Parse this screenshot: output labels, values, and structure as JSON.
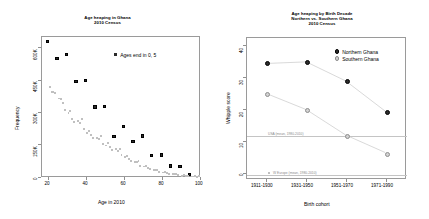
{
  "figure": {
    "width": 429,
    "height": 219,
    "background": "#ffffff",
    "colors": {
      "heaped": "#2b2b2b",
      "non_heaped": "#c0c0c0",
      "northern": "#2b2b2b",
      "southern": "#d2d2d2",
      "axis": "#9a9a9a",
      "reference_line": "#c4c4c4"
    }
  },
  "chart_data": [
    {
      "type": "scatter",
      "id": "age-heaping-scatter",
      "title": "Age heaping in Ghana",
      "subtitle": "2010 Census",
      "xlabel": "Age in 2010",
      "ylabel": "Frequency",
      "xlim": [
        17,
        101
      ],
      "ylim": [
        0,
        660000
      ],
      "xticks": [
        20,
        40,
        60,
        80,
        100
      ],
      "xtick_labels": [
        "20",
        "40",
        "60",
        "80",
        "100"
      ],
      "yticks": [
        0,
        150000,
        300000,
        450000,
        600000
      ],
      "ytick_labels": [
        "0",
        "150K",
        "300K",
        "450K",
        "600K"
      ],
      "grid": false,
      "legend_position": "top-right",
      "series": [
        {
          "name": "Ages end in 0, 5",
          "marker": "filled-square",
          "color": "#2b2b2b",
          "points": [
            {
              "x": 20,
              "y": 638000
            },
            {
              "x": 25,
              "y": 560000
            },
            {
              "x": 30,
              "y": 578000
            },
            {
              "x": 35,
              "y": 453000
            },
            {
              "x": 40,
              "y": 456000
            },
            {
              "x": 45,
              "y": 332000
            },
            {
              "x": 50,
              "y": 336000
            },
            {
              "x": 55,
              "y": 194000
            },
            {
              "x": 60,
              "y": 240000
            },
            {
              "x": 65,
              "y": 172000
            },
            {
              "x": 70,
              "y": 196000
            },
            {
              "x": 75,
              "y": 106000
            },
            {
              "x": 80,
              "y": 108000
            },
            {
              "x": 85,
              "y": 57000
            },
            {
              "x": 90,
              "y": 54000
            },
            {
              "x": 95,
              "y": 17000
            }
          ]
        },
        {
          "name": "Other ages",
          "marker": "small-square",
          "color": "#c0c0c0",
          "points": [
            {
              "x": 21,
              "y": 424000
            },
            {
              "x": 22,
              "y": 403000
            },
            {
              "x": 23,
              "y": 401000
            },
            {
              "x": 24,
              "y": 396000
            },
            {
              "x": 26,
              "y": 372000
            },
            {
              "x": 27,
              "y": 368000
            },
            {
              "x": 28,
              "y": 352000
            },
            {
              "x": 29,
              "y": 318000
            },
            {
              "x": 31,
              "y": 303000
            },
            {
              "x": 32,
              "y": 313000
            },
            {
              "x": 33,
              "y": 276000
            },
            {
              "x": 34,
              "y": 262000
            },
            {
              "x": 36,
              "y": 266000
            },
            {
              "x": 37,
              "y": 258000
            },
            {
              "x": 38,
              "y": 276000
            },
            {
              "x": 39,
              "y": 228000
            },
            {
              "x": 41,
              "y": 212000
            },
            {
              "x": 42,
              "y": 222000
            },
            {
              "x": 43,
              "y": 202000
            },
            {
              "x": 44,
              "y": 186000
            },
            {
              "x": 46,
              "y": 188000
            },
            {
              "x": 47,
              "y": 184000
            },
            {
              "x": 48,
              "y": 196000
            },
            {
              "x": 49,
              "y": 160000
            },
            {
              "x": 51,
              "y": 152000
            },
            {
              "x": 52,
              "y": 163000
            },
            {
              "x": 53,
              "y": 146000
            },
            {
              "x": 54,
              "y": 131000
            },
            {
              "x": 56,
              "y": 134000
            },
            {
              "x": 57,
              "y": 128000
            },
            {
              "x": 58,
              "y": 137000
            },
            {
              "x": 59,
              "y": 106000
            },
            {
              "x": 61,
              "y": 98000
            },
            {
              "x": 62,
              "y": 105000
            },
            {
              "x": 63,
              "y": 90000
            },
            {
              "x": 64,
              "y": 80000
            },
            {
              "x": 66,
              "y": 76000
            },
            {
              "x": 67,
              "y": 73000
            },
            {
              "x": 68,
              "y": 78000
            },
            {
              "x": 69,
              "y": 58000
            },
            {
              "x": 71,
              "y": 54000
            },
            {
              "x": 72,
              "y": 58000
            },
            {
              "x": 73,
              "y": 48000
            },
            {
              "x": 74,
              "y": 42000
            },
            {
              "x": 76,
              "y": 39000
            },
            {
              "x": 77,
              "y": 37000
            },
            {
              "x": 78,
              "y": 39000
            },
            {
              "x": 79,
              "y": 29000
            },
            {
              "x": 81,
              "y": 26000
            },
            {
              "x": 82,
              "y": 28000
            },
            {
              "x": 83,
              "y": 23000
            },
            {
              "x": 84,
              "y": 20000
            },
            {
              "x": 86,
              "y": 18000
            },
            {
              "x": 87,
              "y": 17000
            },
            {
              "x": 88,
              "y": 18000
            },
            {
              "x": 89,
              "y": 13000
            },
            {
              "x": 91,
              "y": 11000
            },
            {
              "x": 92,
              "y": 12000
            },
            {
              "x": 93,
              "y": 9000
            },
            {
              "x": 94,
              "y": 8000
            },
            {
              "x": 96,
              "y": 7000
            },
            {
              "x": 97,
              "y": 7000
            },
            {
              "x": 98,
              "y": 8000
            },
            {
              "x": 99,
              "y": 6000
            },
            {
              "x": 100,
              "y": 9000
            }
          ]
        }
      ],
      "legend": [
        {
          "label": "Ages end in 0, 5",
          "marker": "filled-square",
          "color": "#2b2b2b"
        }
      ]
    },
    {
      "type": "line",
      "id": "age-heaping-by-birth-decade",
      "title": "Age heaping by Birth Decade",
      "subtitle": "Northern vs. Southern Ghana",
      "subtitle2": "2010 Census",
      "xlabel": "Birth cohort",
      "ylabel": "Whipple score",
      "categories": [
        "1911-1930",
        "1931-1950",
        "1951-1970",
        "1971-1990"
      ],
      "ylim": [
        0,
        44
      ],
      "yticks": [
        0,
        10,
        20,
        30,
        40
      ],
      "ytick_labels": [
        "0",
        "10",
        "20",
        "30",
        "40"
      ],
      "grid": false,
      "legend_position": "top-right",
      "series": [
        {
          "name": "Northern Ghana",
          "color": "#2b2b2b",
          "marker": "filled-circle",
          "values": [
            36.0,
            36.5,
            30.5,
            21.0
          ]
        },
        {
          "name": "Southern Ghana",
          "color": "#d2d2d2",
          "marker": "open-circle",
          "values": [
            26.5,
            21.5,
            13.5,
            8.0
          ]
        }
      ],
      "annotations": [
        {
          "label": "USA (mean, 1980-2010)",
          "value": 13.5,
          "marker": false
        },
        {
          "label": "W Europe (mean, 1980-2010)",
          "value": 1.5,
          "marker": true
        }
      ],
      "legend": [
        {
          "label": "Northern Ghana",
          "marker": "filled-circle",
          "color": "#2b2b2b"
        },
        {
          "label": "Southern Ghana",
          "marker": "open-circle",
          "color": "#d2d2d2"
        }
      ]
    }
  ]
}
